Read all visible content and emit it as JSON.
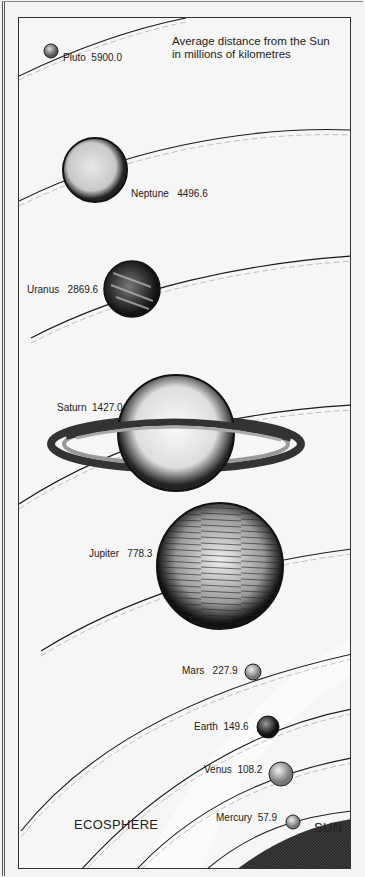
{
  "caption": {
    "line1": "Average distance from the Sun",
    "line2": "in millions of kilometres"
  },
  "regions": {
    "ecosphere": "ECOSPHERE",
    "sun": "SUN"
  },
  "planets": [
    {
      "name": "Pluto",
      "distance": "5900.0"
    },
    {
      "name": "Neptune",
      "distance": "4496.6"
    },
    {
      "name": "Uranus",
      "distance": "2869.6"
    },
    {
      "name": "Saturn",
      "distance": "1427.0"
    },
    {
      "name": "Jupiter",
      "distance": "778.3"
    },
    {
      "name": "Mars",
      "distance": "227.9"
    },
    {
      "name": "Earth",
      "distance": "149.6"
    },
    {
      "name": "Venus",
      "distance": "108.2"
    },
    {
      "name": "Mercury",
      "distance": "57.9"
    }
  ],
  "colors": {
    "ink": "#1a1a1a",
    "paper": "#f6f6f6",
    "sun": "#2a2a2a"
  }
}
